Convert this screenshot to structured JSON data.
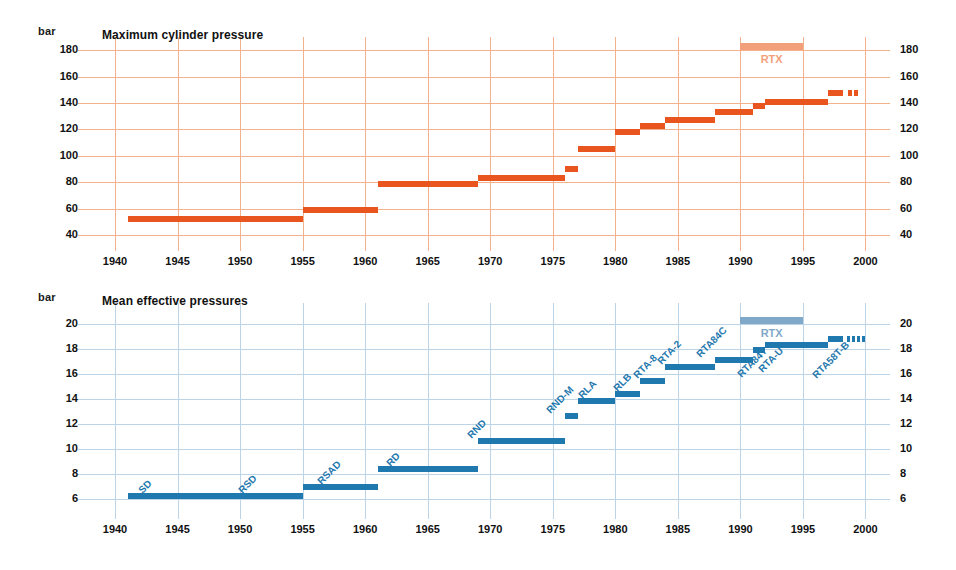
{
  "figure": {
    "background": "#ffffff",
    "orange": "#e8551f",
    "orange_light": "#f2a07a",
    "orange_grid": "#f3b28c",
    "blue": "#1f78ae",
    "blue_light": "#7fa8c9",
    "blue_grid": "#bdd4e6"
  },
  "chart_data": [
    {
      "type": "bar",
      "id": "maximum-cylinder-pressure",
      "title": "Maximum cylinder pressure",
      "ylabel": "bar",
      "xlabel": "",
      "grid": true,
      "legend": false,
      "color": "#e8551f",
      "xlim": [
        1938,
        2001
      ],
      "ylim": [
        34,
        184
      ],
      "xticks": [
        1940,
        1945,
        1950,
        1955,
        1960,
        1965,
        1970,
        1975,
        1980,
        1985,
        1990,
        1995,
        2000
      ],
      "yticks": [
        40,
        60,
        80,
        100,
        120,
        140,
        160,
        180
      ],
      "annotations": [
        {
          "text": "RTX",
          "x_start": 1990,
          "x_end": 1995,
          "y": 180,
          "kind": "band"
        }
      ],
      "segments": [
        {
          "x_start": 1941.0,
          "x_end": 1955.0,
          "y": 52
        },
        {
          "x_start": 1955.0,
          "x_end": 1961.0,
          "y": 59
        },
        {
          "x_start": 1961.0,
          "x_end": 1969.0,
          "y": 79
        },
        {
          "x_start": 1969.0,
          "x_end": 1976.0,
          "y": 83
        },
        {
          "x_start": 1976.0,
          "x_end": 1977.0,
          "y": 90
        },
        {
          "x_start": 1977.0,
          "x_end": 1980.0,
          "y": 105
        },
        {
          "x_start": 1980.0,
          "x_end": 1982.0,
          "y": 118
        },
        {
          "x_start": 1982.0,
          "x_end": 1984.0,
          "y": 123
        },
        {
          "x_start": 1984.0,
          "x_end": 1988.0,
          "y": 127
        },
        {
          "x_start": 1988.0,
          "x_end": 1991.0,
          "y": 133
        },
        {
          "x_start": 1991.0,
          "x_end": 1992.0,
          "y": 138
        },
        {
          "x_start": 1992.0,
          "x_end": 1997.0,
          "y": 141
        },
        {
          "x_start": 1997.0,
          "x_end": 1998.2,
          "y": 148
        }
      ],
      "dashes": [
        {
          "x_start": 1998.6,
          "x_end": 1998.9,
          "y": 148
        },
        {
          "x_start": 1999.1,
          "x_end": 1999.4,
          "y": 148
        }
      ]
    },
    {
      "type": "bar",
      "id": "mean-effective-pressures",
      "title": "Mean effective pressures",
      "ylabel": "bar",
      "xlabel": "",
      "grid": true,
      "legend": false,
      "color": "#1f78ae",
      "xlim": [
        1938,
        2001
      ],
      "ylim": [
        5,
        21
      ],
      "xticks": [
        1940,
        1945,
        1950,
        1955,
        1960,
        1965,
        1970,
        1975,
        1980,
        1985,
        1990,
        1995,
        2000
      ],
      "yticks": [
        6,
        8,
        10,
        12,
        14,
        16,
        18,
        20
      ],
      "annotations": [
        {
          "text": "RTX",
          "x_start": 1990,
          "x_end": 1995,
          "y": 20,
          "kind": "band"
        }
      ],
      "segments": [
        {
          "label": "SD",
          "x_start": 1941.0,
          "x_end": 1955.0,
          "y": 6.2
        },
        {
          "label": "RSD",
          "x_start": 1941.0,
          "x_end": 1955.0,
          "y": 6.2
        },
        {
          "label": "RSAD",
          "x_start": 1955.0,
          "x_end": 1961.0,
          "y": 6.9
        },
        {
          "label": "RD",
          "x_start": 1961.0,
          "x_end": 1969.0,
          "y": 8.4
        },
        {
          "label": "RND",
          "x_start": 1969.0,
          "x_end": 1976.0,
          "y": 10.6
        },
        {
          "label": "RND-M",
          "x_start": 1976.0,
          "x_end": 1977.0,
          "y": 12.6
        },
        {
          "label": "RLA",
          "x_start": 1977.0,
          "x_end": 1980.0,
          "y": 13.8
        },
        {
          "label": "RLB",
          "x_start": 1980.0,
          "x_end": 1982.0,
          "y": 14.4
        },
        {
          "label": "RTA-8",
          "x_start": 1982.0,
          "x_end": 1984.0,
          "y": 15.4
        },
        {
          "label": "RTA-2",
          "x_start": 1984.0,
          "x_end": 1988.0,
          "y": 16.5
        },
        {
          "label": "RTA84C",
          "x_start": 1988.0,
          "x_end": 1991.0,
          "y": 17.1
        },
        {
          "label": "RTA84T",
          "x_start": 1991.0,
          "x_end": 1992.0,
          "y": 17.9
        },
        {
          "label": "RTA-U",
          "x_start": 1992.0,
          "x_end": 1997.0,
          "y": 18.3
        },
        {
          "label": "RTA58T-B",
          "x_start": 1997.0,
          "x_end": 1998.2,
          "y": 18.8
        }
      ],
      "dashes": [
        {
          "x_start": 1998.5,
          "x_end": 1998.75,
          "y": 18.8
        },
        {
          "x_start": 1998.9,
          "x_end": 1999.15,
          "y": 18.8
        },
        {
          "x_start": 1999.3,
          "x_end": 1999.55,
          "y": 18.8
        },
        {
          "x_start": 1999.7,
          "x_end": 1999.95,
          "y": 18.8
        }
      ],
      "label_positions": [
        {
          "label": "SD",
          "x": 1942.0,
          "y": 7.0
        },
        {
          "label": "RSD",
          "x": 1950.0,
          "y": 7.0
        },
        {
          "label": "RSAD",
          "x": 1956.3,
          "y": 7.7
        },
        {
          "label": "RD",
          "x": 1961.8,
          "y": 9.2
        },
        {
          "label": "RND",
          "x": 1968.3,
          "y": 11.4
        },
        {
          "label": "RND-M",
          "x": 1974.6,
          "y": 13.4
        },
        {
          "label": "RLA",
          "x": 1977.2,
          "y": 14.6
        },
        {
          "label": "RLB",
          "x": 1980.0,
          "y": 15.2
        },
        {
          "label": "RTA-8",
          "x": 1981.6,
          "y": 16.2
        },
        {
          "label": "RTA-2",
          "x": 1983.5,
          "y": 17.3
        },
        {
          "label": "RTA84C",
          "x": 1986.6,
          "y": 17.9
        },
        {
          "label": "RTA84T",
          "x": 1989.9,
          "y": 16.3
        },
        {
          "label": "RTA-U",
          "x": 1991.6,
          "y": 16.7
        },
        {
          "label": "RTA58T-B",
          "x": 1995.9,
          "y": 16.2
        }
      ]
    }
  ]
}
